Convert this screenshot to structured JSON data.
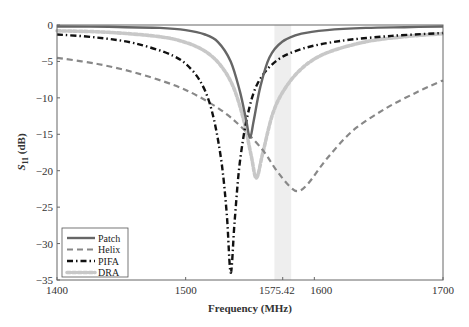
{
  "chart_data": {
    "type": "line",
    "title": "",
    "xlabel": "Frequency (MHz)",
    "ylabel": "S11 (dB)",
    "ylabel_main": "S",
    "ylabel_sub": "11",
    "ylabel_unit": " (dB)",
    "xlim": [
      1400,
      1700
    ],
    "ylim": [
      -35,
      0
    ],
    "xticks": [
      1400,
      1500,
      1575.42,
      1600,
      1700
    ],
    "xtick_labels": [
      "1400",
      "1500",
      "1575.42",
      "1600",
      "1700"
    ],
    "yticks": [
      0,
      -5,
      -10,
      -15,
      -20,
      -25,
      -30,
      -35
    ],
    "ytick_labels": [
      "0",
      "−5",
      "−10",
      "−15",
      "−20",
      "−25",
      "−30",
      "−35"
    ],
    "grid": false,
    "highlight_band": {
      "from": 1569,
      "to": 1582,
      "color": "#eeeeee"
    },
    "legend_position": "lower left",
    "series": [
      {
        "name": "Patch",
        "style": "solid",
        "color": "#666666",
        "x": [
          1400,
          1440,
          1480,
          1500,
          1515,
          1525,
          1535,
          1542,
          1547,
          1550,
          1553,
          1558,
          1565,
          1575,
          1590,
          1610,
          1640,
          1670,
          1700
        ],
        "y": [
          -0.2,
          -0.25,
          -0.4,
          -0.7,
          -1.3,
          -2.3,
          -5,
          -9,
          -13,
          -15.5,
          -13,
          -8.5,
          -4.5,
          -2.3,
          -1.2,
          -0.7,
          -0.4,
          -0.3,
          -0.2
        ]
      },
      {
        "name": "Helix",
        "style": "dashed",
        "color": "#888888",
        "x": [
          1400,
          1430,
          1460,
          1490,
          1510,
          1530,
          1545,
          1560,
          1570,
          1580,
          1587,
          1595,
          1610,
          1630,
          1655,
          1680,
          1700
        ],
        "y": [
          -4.5,
          -5.3,
          -6.5,
          -8.2,
          -9.8,
          -12,
          -14.3,
          -17.2,
          -19.8,
          -22,
          -22.8,
          -21.8,
          -18.3,
          -14.5,
          -11.5,
          -9.2,
          -7.6
        ]
      },
      {
        "name": "PIFA",
        "style": "dashdot",
        "color": "#111111",
        "x": [
          1400,
          1430,
          1460,
          1490,
          1505,
          1515,
          1522,
          1528,
          1532,
          1535,
          1538,
          1542,
          1548,
          1556,
          1570,
          1590,
          1620,
          1660,
          1700
        ],
        "y": [
          -1.3,
          -1.7,
          -2.5,
          -4.2,
          -6.2,
          -9,
          -13,
          -19,
          -26,
          -34,
          -27,
          -19,
          -12.5,
          -8,
          -5,
          -3.3,
          -2.2,
          -1.5,
          -1.1
        ]
      },
      {
        "name": "DRA",
        "style": "dotted-thick",
        "color": "#c8c8c8",
        "x": [
          1400,
          1440,
          1480,
          1500,
          1515,
          1527,
          1537,
          1545,
          1551,
          1555,
          1560,
          1568,
          1578,
          1592,
          1610,
          1640,
          1670,
          1700
        ],
        "y": [
          -0.8,
          -1.0,
          -1.6,
          -2.4,
          -3.6,
          -5.5,
          -8.5,
          -13,
          -18,
          -21,
          -17.5,
          -12,
          -8.5,
          -5.7,
          -3.8,
          -2.3,
          -1.6,
          -1.2
        ]
      }
    ]
  }
}
